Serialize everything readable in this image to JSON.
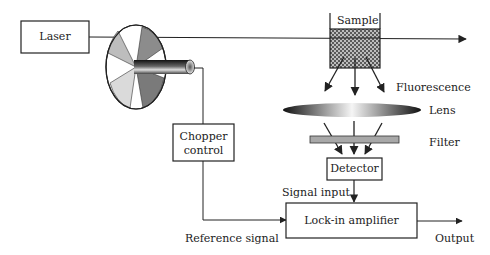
{
  "diagram": {
    "type": "lock-in fluorescence detection setup",
    "nodes": {
      "laser": "Laser",
      "chopper_control_line1": "Chopper",
      "chopper_control_line2": "control",
      "sample": "Sample",
      "fluorescence": "Fluorescence",
      "lens": "Lens",
      "filter": "Filter",
      "detector": "Detector",
      "lockin": "Lock-in amplifier"
    },
    "edge_labels": {
      "signal_input": "Signal input",
      "reference_signal": "Reference signal",
      "output": "Output"
    },
    "colors": {
      "line": "#222222",
      "filter_fill": "#a8a8a8",
      "sample_fill": "#6a6a6a"
    }
  }
}
